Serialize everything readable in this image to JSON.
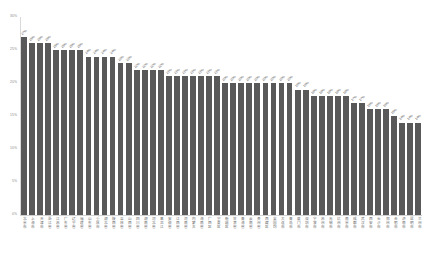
{
  "chart_data": {
    "type": "bar",
    "title": "",
    "subtitle": "",
    "xlabel": "",
    "ylabel": "",
    "ylim": [
      0,
      30
    ],
    "grid": false,
    "legend": null,
    "orientation": "vertical",
    "value_suffix": "%",
    "bar_color": "#595959",
    "y_ticks": [
      "30%",
      "25%",
      "20%",
      "15%",
      "10%",
      "5%",
      "0%"
    ],
    "y_tick_values": [
      30,
      25,
      20,
      15,
      10,
      5,
      0
    ],
    "categories": [
      "北京市",
      "上海市",
      "天津市",
      "浙江省",
      "江苏省",
      "广东省",
      "辽宁省",
      "福建省",
      "山东省",
      "重庆市",
      "湖北省",
      "陕西省",
      "吉林省",
      "山西省",
      "四川省",
      "湖南省",
      "河北省",
      "黑龙江",
      "安徽省",
      "江西省",
      "河南省",
      "内蒙古",
      "海南省",
      "广西区",
      "宁夏区",
      "新疆区",
      "甘肃省",
      "青海省",
      "云南省",
      "贵州省",
      "西藏区",
      "全国均",
      "大连市",
      "青岛市",
      "厦门市",
      "深圳市",
      "宁波市",
      "苏州市",
      "无锡市",
      "杭州市",
      "南京市",
      "成都市",
      "武汉市",
      "西安市",
      "长沙市",
      "郑州市",
      "合肥市",
      "济南市",
      "昆明市",
      "兰州市"
    ],
    "values": [
      27,
      26,
      26,
      26,
      25,
      25,
      25,
      25,
      24,
      24,
      24,
      24,
      23,
      23,
      22,
      22,
      22,
      22,
      21,
      21,
      21,
      21,
      21,
      21,
      21,
      20,
      20,
      20,
      20,
      20,
      20,
      20,
      20,
      20,
      19,
      19,
      18,
      18,
      18,
      18,
      18,
      17,
      17,
      16,
      16,
      16,
      15,
      14,
      14,
      14
    ],
    "data_labels": [
      "27%",
      "26%",
      "26%",
      "26%",
      "25%",
      "25%",
      "25%",
      "25%",
      "24%",
      "24%",
      "24%",
      "24%",
      "23%",
      "23%",
      "22%",
      "22%",
      "22%",
      "22%",
      "21%",
      "21%",
      "21%",
      "21%",
      "21%",
      "21%",
      "21%",
      "20%",
      "20%",
      "20%",
      "20%",
      "20%",
      "20%",
      "20%",
      "20%",
      "20%",
      "19%",
      "19%",
      "18%",
      "18%",
      "18%",
      "18%",
      "18%",
      "17%",
      "17%",
      "16%",
      "16%",
      "16%",
      "15%",
      "14%",
      "14%",
      "14%"
    ]
  }
}
